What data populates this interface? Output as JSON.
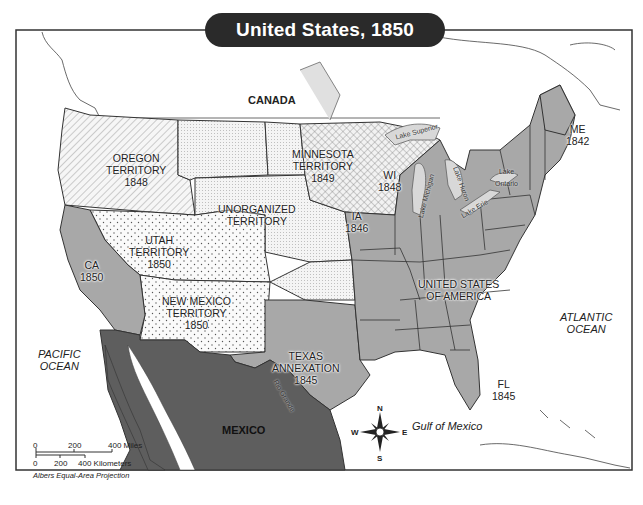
{
  "title": "United States, 1850",
  "colors": {
    "states": "#a8a8a8",
    "mexico": "#5e5e5e",
    "territory_light": "#f4f4f4",
    "lakes": "#d8d8d8",
    "border": "#333333",
    "title_bg": "#2a2a2a"
  },
  "countries": {
    "canada": "CANADA",
    "mexico": "MEXICO",
    "usa_line1": "UNITED STATES",
    "usa_line2": "OF AMERICA"
  },
  "oceans": {
    "pacific_line1": "PACIFIC",
    "pacific_line2": "OCEAN",
    "atlantic_line1": "ATLANTIC",
    "atlantic_line2": "OCEAN",
    "gulf": "Gulf of Mexico"
  },
  "territories": [
    {
      "name": "OREGON",
      "line2": "TERRITORY",
      "year": "1848",
      "pattern": "diagonal-hatch"
    },
    {
      "name": "MINNESOTA",
      "line2": "TERRITORY",
      "year": "1849",
      "pattern": "crosshatch"
    },
    {
      "name": "UNORGANIZED",
      "line2": "TERRITORY",
      "year": "",
      "pattern": "fine-dots"
    },
    {
      "name": "UTAH",
      "line2": "TERRITORY",
      "year": "1850",
      "pattern": "sparse-dots"
    },
    {
      "name": "NEW MEXICO",
      "line2": "TERRITORY",
      "year": "1850",
      "pattern": "sparse-dots"
    }
  ],
  "states": [
    {
      "abbr": "CA",
      "year": "1850"
    },
    {
      "abbr": "WI",
      "year": "1848"
    },
    {
      "abbr": "IA",
      "year": "1846"
    },
    {
      "abbr": "ME",
      "year": "1842"
    },
    {
      "abbr": "FL",
      "year": "1845"
    }
  ],
  "texas": {
    "line1": "TEXAS",
    "line2": "ANNEXATION",
    "year": "1845"
  },
  "lakes": [
    "Lake Superior",
    "Lake Michigan",
    "Lake Huron",
    "Lake Erie",
    "Lake Ontario"
  ],
  "lake_ontario_line1": "Lake",
  "lake_ontario_line2": "Ontario",
  "river": "Rio Grande",
  "compass": {
    "n": "N",
    "s": "S",
    "e": "E",
    "w": "W"
  },
  "scale": {
    "miles_ticks": [
      "0",
      "200",
      "400 Miles"
    ],
    "km_ticks": [
      "0",
      "200",
      "400 Kilometers"
    ],
    "projection": "Albers Equal-Area Projection"
  }
}
